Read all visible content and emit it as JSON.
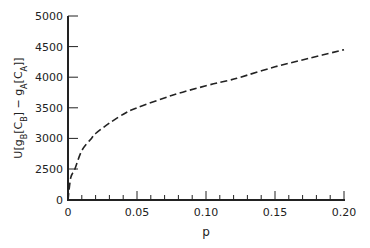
{
  "chart_data": {
    "type": "line",
    "title": "",
    "xlabel": "p",
    "ylabel": "U[g_B[C_B] − g_A[C_A]]",
    "ylabel_parts": {
      "pre": "U[g",
      "sub1": "B",
      "mid1": "[C",
      "sub2": "B",
      "mid2": "] − g",
      "sub3": "A",
      "mid3": "[C",
      "sub4": "A",
      "post": "]]"
    },
    "xlim": [
      0,
      0.2
    ],
    "ylim": [
      0,
      5000
    ],
    "y_axis_break": "between 0 and 2500",
    "x_ticks": [
      0,
      0.05,
      0.1,
      0.15,
      0.2
    ],
    "x_tick_labels": [
      "0",
      "0.05",
      "0.10",
      "0.15",
      "0.20"
    ],
    "x_minor_tick_step": 0.01,
    "y_ticks": [
      0,
      2500,
      3000,
      3500,
      4000,
      4500,
      5000
    ],
    "y_tick_labels": [
      "0",
      "2500",
      "3000",
      "3500",
      "4000",
      "4500",
      "5000"
    ],
    "grid": false,
    "legend": null,
    "series": [
      {
        "name": "U[g_B[C_B] − g_A[C_A]]",
        "style": "dashed",
        "color": "#222222",
        "x": [
          0,
          0.002,
          0.005,
          0.01,
          0.017,
          0.02,
          0.03,
          0.042,
          0.05,
          0.075,
          0.1,
          0.117,
          0.125,
          0.15,
          0.175,
          0.2
        ],
        "y": [
          0,
          1800,
          2500,
          2800,
          3000,
          3080,
          3250,
          3420,
          3500,
          3700,
          3860,
          3950,
          4000,
          4170,
          4310,
          4450
        ]
      }
    ]
  }
}
